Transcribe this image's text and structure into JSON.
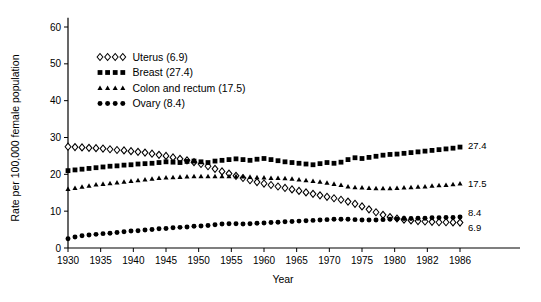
{
  "chart_data": {
    "type": "line",
    "title": "",
    "xlabel": "Year",
    "ylabel": "Rate per 100,000 female population",
    "grid": false,
    "legend_position": "upper-center-left",
    "ylim": [
      0,
      63
    ],
    "yticks": [
      0,
      10,
      20,
      30,
      40,
      50,
      60
    ],
    "xticks": [
      "1930",
      "1935",
      "1940",
      "1945",
      "1950",
      "1955",
      "1960",
      "1965",
      "1970",
      "1975",
      "1980",
      "1982",
      "1986"
    ],
    "xlim": [
      1930,
      1986
    ],
    "x": [
      1930,
      1931,
      1932,
      1933,
      1934,
      1935,
      1936,
      1937,
      1938,
      1939,
      1940,
      1941,
      1942,
      1943,
      1944,
      1945,
      1946,
      1947,
      1948,
      1949,
      1950,
      1951,
      1952,
      1953,
      1954,
      1955,
      1956,
      1957,
      1958,
      1959,
      1960,
      1961,
      1962,
      1963,
      1964,
      1965,
      1966,
      1967,
      1968,
      1969,
      1970,
      1971,
      1972,
      1973,
      1974,
      1975,
      1976,
      1977,
      1978,
      1979,
      1980,
      1981,
      1982,
      1983,
      1984,
      1985,
      1986
    ],
    "series": [
      {
        "name": "Uterus",
        "end_value": 6.9,
        "end_label": "6.9",
        "marker": "open-diamond",
        "legend_label": "Uterus (6.9)",
        "values": [
          27.5,
          27.4,
          27.3,
          27.2,
          27.1,
          27.0,
          26.8,
          26.6,
          26.5,
          26.3,
          26.1,
          25.9,
          25.6,
          25.3,
          25.0,
          24.6,
          24.2,
          23.8,
          23.3,
          22.8,
          22.2,
          21.5,
          20.8,
          20.2,
          19.6,
          19.0,
          18.4,
          17.9,
          17.5,
          17.1,
          16.7,
          16.3,
          15.9,
          15.5,
          15.1,
          14.7,
          14.3,
          13.9,
          13.5,
          13.1,
          12.6,
          12.0,
          11.3,
          10.5,
          9.7,
          9.0,
          8.4,
          8.0,
          7.7,
          7.5,
          7.3,
          7.2,
          7.1,
          7.0,
          7.0,
          6.95,
          6.9
        ]
      },
      {
        "name": "Breast",
        "end_value": 27.4,
        "end_label": "27.4",
        "marker": "filled-square",
        "legend_label": "Breast (27.4)",
        "values": [
          21.0,
          21.2,
          21.4,
          21.6,
          21.8,
          22.0,
          22.2,
          22.3,
          22.5,
          22.6,
          22.8,
          22.9,
          23.0,
          23.2,
          23.4,
          23.3,
          23.2,
          23.5,
          23.6,
          23.4,
          23.2,
          23.6,
          23.8,
          24.0,
          24.2,
          24.0,
          23.8,
          24.1,
          24.3,
          24.0,
          23.7,
          23.4,
          23.2,
          23.0,
          22.8,
          22.6,
          22.9,
          23.2,
          23.0,
          23.3,
          24.0,
          24.5,
          24.3,
          24.6,
          24.9,
          25.2,
          25.4,
          25.5,
          25.7,
          25.9,
          26.1,
          26.3,
          26.5,
          26.7,
          26.9,
          27.1,
          27.4
        ]
      },
      {
        "name": "Colon and rectum",
        "end_value": 17.5,
        "end_label": "17.5",
        "marker": "filled-triangle",
        "legend_label": "Colon and rectum (17.5)",
        "values": [
          16.0,
          16.3,
          16.6,
          16.9,
          17.2,
          17.4,
          17.6,
          17.8,
          18.0,
          18.2,
          18.4,
          18.6,
          18.8,
          19.0,
          19.1,
          19.2,
          19.3,
          19.4,
          19.5,
          19.5,
          19.5,
          19.5,
          19.5,
          19.5,
          19.5,
          19.4,
          19.3,
          19.2,
          19.1,
          19.0,
          19.0,
          18.9,
          18.8,
          18.6,
          18.4,
          18.2,
          18.0,
          17.7,
          17.4,
          17.1,
          16.7,
          16.5,
          16.4,
          16.3,
          16.2,
          16.2,
          16.2,
          16.3,
          16.4,
          16.5,
          16.6,
          16.7,
          16.9,
          17.0,
          17.1,
          17.3,
          17.5
        ]
      },
      {
        "name": "Ovary",
        "end_value": 8.4,
        "end_label": "8.4",
        "marker": "filled-circle",
        "legend_label": "Ovary (8.4)",
        "values": [
          2.5,
          3.0,
          3.3,
          3.5,
          3.7,
          3.9,
          4.0,
          4.2,
          4.4,
          4.6,
          4.7,
          4.9,
          5.0,
          5.2,
          5.3,
          5.5,
          5.6,
          5.7,
          5.9,
          6.0,
          6.1,
          6.3,
          6.5,
          6.6,
          6.6,
          6.5,
          6.6,
          6.7,
          6.8,
          6.9,
          7.0,
          7.1,
          7.2,
          7.3,
          7.4,
          7.5,
          7.6,
          7.7,
          7.8,
          7.8,
          7.8,
          7.7,
          7.6,
          7.6,
          7.6,
          7.7,
          7.8,
          7.9,
          8.0,
          8.0,
          8.1,
          8.1,
          8.2,
          8.2,
          8.3,
          8.3,
          8.4
        ]
      }
    ]
  },
  "legend": {
    "items": [
      {
        "label": "Uterus (6.9)",
        "marker": "open-diamond"
      },
      {
        "label": "Breast (27.4)",
        "marker": "filled-square"
      },
      {
        "label": "Colon and rectum (17.5)",
        "marker": "filled-triangle"
      },
      {
        "label": "Ovary (8.4)",
        "marker": "filled-circle"
      }
    ]
  },
  "colors": {
    "axis": "#000000",
    "marker": "#000000",
    "background": "#ffffff"
  }
}
